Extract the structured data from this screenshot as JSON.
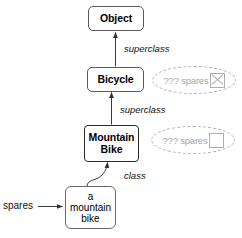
{
  "diagram": {
    "colors": {
      "node_border": "#5b5b5b",
      "node_border_strong": "#2b2b2b",
      "edge": "#333333",
      "ghost": "#a8a8a8",
      "background": "#ffffff"
    },
    "nodes": [
      {
        "id": "object",
        "label": "Object"
      },
      {
        "id": "bicycle",
        "label": "Bicycle"
      },
      {
        "id": "mountain-bike",
        "label_line1": "Mountain",
        "label_line2": "Bike"
      },
      {
        "id": "instance",
        "label_line1": "a",
        "label_line2": "mountain",
        "label_line3": "bike"
      }
    ],
    "edge_labels": {
      "superclass_upper": "superclass",
      "superclass_lower": "superclass",
      "class": "class",
      "spares": "spares"
    },
    "ghosts": [
      {
        "id": "ghost-bicycle",
        "text": "??? spares",
        "box": "crossed"
      },
      {
        "id": "ghost-mountain-bike",
        "text": "??? spares",
        "box": "empty"
      }
    ]
  }
}
